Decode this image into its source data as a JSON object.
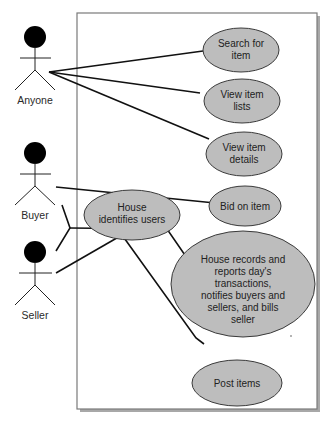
{
  "diagram": {
    "type": "uml-use-case",
    "colors": {
      "ellipse_fill": "#bdbdbd",
      "ellipse_stroke": "#3a3a3a",
      "line": "#111111",
      "boundary": "#7a7a7a",
      "boundary_shadow": "#a8a8a8",
      "actor_head": "#000000"
    },
    "actors": [
      {
        "id": "anyone",
        "label": "Anyone"
      },
      {
        "id": "buyer",
        "label": "Buyer"
      },
      {
        "id": "seller",
        "label": "Seller"
      }
    ],
    "use_cases": [
      {
        "id": "search",
        "lines": [
          "Search for",
          "item"
        ]
      },
      {
        "id": "view_lists",
        "lines": [
          "View item",
          "lists"
        ]
      },
      {
        "id": "view_details",
        "lines": [
          "View item",
          "details"
        ]
      },
      {
        "id": "bid",
        "lines": [
          "Bid on item"
        ]
      },
      {
        "id": "identify",
        "lines": [
          "House",
          "identifies users"
        ]
      },
      {
        "id": "records",
        "lines": [
          "House records and",
          "reports day's",
          "transactions,",
          "notifies buyers and",
          "sellers, and bills",
          "seller"
        ]
      },
      {
        "id": "post",
        "lines": [
          "Post items"
        ]
      }
    ],
    "associations": [
      {
        "from": "anyone",
        "to": "search"
      },
      {
        "from": "anyone",
        "to": "view_lists"
      },
      {
        "from": "anyone",
        "to": "view_details"
      },
      {
        "from": "buyer",
        "to": "bid"
      },
      {
        "from": "buyer+seller",
        "to": "identify"
      },
      {
        "from": "buyer+seller",
        "to": "records"
      },
      {
        "from": "seller",
        "to": "identify"
      },
      {
        "from": "seller",
        "to": "post"
      }
    ]
  }
}
